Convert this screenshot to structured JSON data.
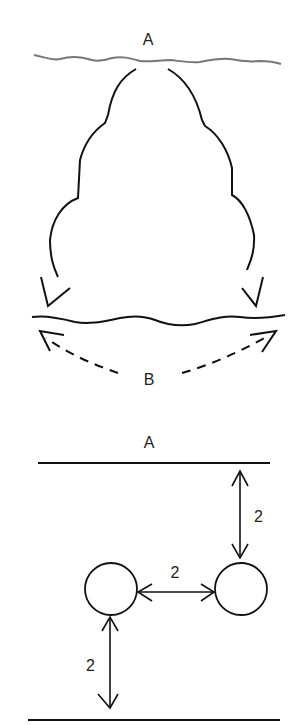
{
  "top_figure": {
    "surface_label": "A",
    "bottom_surface_label": "B",
    "description": "Bubble expanding from surface A, arrows pointing down to surface B, dashed arrows spreading outward along B"
  },
  "bottom_figure": {
    "surface_label": "A",
    "distance_top": "2",
    "distance_between": "2",
    "distance_bottom": "2"
  }
}
